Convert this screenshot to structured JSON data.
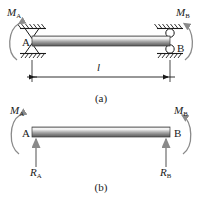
{
  "figure": {
    "title_a": "(a)",
    "title_b": "(b)"
  },
  "figure_a": {
    "caption": "(a)",
    "moment_left": {
      "symbol": "M",
      "subscript": "A",
      "name": "moment-A"
    },
    "moment_right": {
      "symbol": "M",
      "subscript": "B",
      "name": "moment-B"
    },
    "node_left": "A",
    "node_right": "B",
    "span_label": "l",
    "support_left_type": "fixed-support-hatched",
    "support_right_type": "roller-support-hatched"
  },
  "figure_b": {
    "caption": "(b)",
    "moment_left": {
      "symbol": "M",
      "subscript": "A"
    },
    "moment_right": {
      "symbol": "M",
      "subscript": "B"
    },
    "node_left": "A",
    "node_right": "B",
    "reaction_left": {
      "symbol": "R",
      "subscript": "A"
    },
    "reaction_right": {
      "symbol": "R",
      "subscript": "B"
    }
  },
  "style": {
    "line_color": "#1a1a1a",
    "beam_light": "#f2f2f2",
    "beam_mid": "#b8b8b8",
    "beam_dark": "#6e6e6e",
    "arc_color": "#808080",
    "arrow_color": "#8a8a8a"
  }
}
